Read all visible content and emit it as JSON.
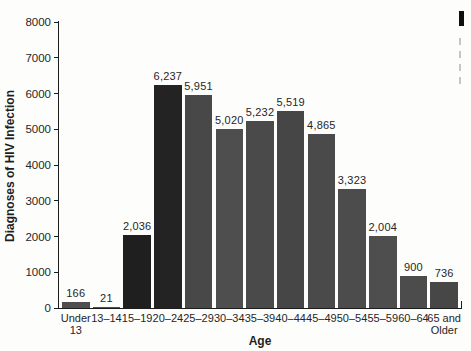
{
  "figure": {
    "background": "#fdfdfc",
    "note": "bar chart, scanned-book style, caption cut off at right edge"
  },
  "chart_data": {
    "type": "bar",
    "title": "",
    "xlabel": "Age",
    "ylabel": "Diagnoses of HIV Infection",
    "ylim": [
      0,
      8000
    ],
    "ytick_step": 1000,
    "ytick_labels": [
      "0",
      "1000",
      "2000",
      "3000",
      "4000",
      "5000",
      "6000",
      "7000",
      "8000"
    ],
    "grid": "off",
    "legend": "none",
    "categories": [
      "Under\n13",
      "13–14",
      "15–19",
      "20–24",
      "25–29",
      "30–34",
      "35–39",
      "40–44",
      "45–49",
      "50–54",
      "55–59",
      "60–64",
      "65 and\nOlder"
    ],
    "values": [
      166,
      21,
      2036,
      6237,
      5951,
      5020,
      5232,
      5519,
      4865,
      3323,
      2004,
      900,
      736
    ],
    "value_labels": [
      "166",
      "21",
      "2,036",
      "6,237",
      "5,951",
      "5,020",
      "5,232",
      "5,519",
      "4,865",
      "3,323",
      "2,004",
      "900",
      "736"
    ],
    "bar_colors": [
      "#4e4e4e",
      "#4e4e4e",
      "#1f1f1f",
      "#232323",
      "#484848",
      "#4e4e4e",
      "#4a4a4a",
      "#464646",
      "#4a4a4a",
      "#4c4c4c",
      "#4e4e4e",
      "#4c4c4c",
      "#474747"
    ],
    "colors": {
      "axis": "#1c1c1c",
      "text": "#262626",
      "bar_default": "#4c4c4c",
      "bar_highlight": "#212121"
    }
  },
  "cutoff_caption": {
    "present": true,
    "description": "left edge of a caption block cropped at image border",
    "line_stub_count": 4
  }
}
